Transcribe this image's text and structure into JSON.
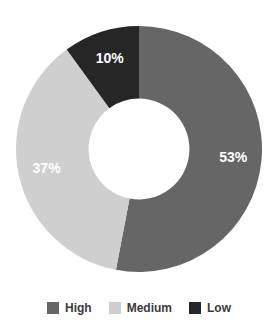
{
  "chart_data": {
    "type": "pie",
    "variant": "donut",
    "title": "",
    "xlabel": "",
    "ylabel": "",
    "categories": [
      "High",
      "Medium",
      "Low"
    ],
    "values": [
      53,
      37,
      10
    ],
    "unit": "%",
    "data_labels": [
      "53%",
      "37%",
      "10%"
    ],
    "colors": [
      "#666666",
      "#cfcfcf",
      "#262626"
    ],
    "label_color": "#ffffff",
    "background": "#ffffff",
    "start_angle_deg": 0,
    "direction": "clockwise",
    "inner_radius_ratio": 0.41,
    "grid": false,
    "legend": {
      "position": "bottom",
      "entries": [
        {
          "label": "High",
          "color": "#666666",
          "value": 53,
          "data_label": "53%"
        },
        {
          "label": "Medium",
          "color": "#cfcfcf",
          "value": 37,
          "data_label": "37%"
        },
        {
          "label": "Low",
          "color": "#262626",
          "value": 10,
          "data_label": "10%"
        }
      ]
    }
  },
  "slices": [
    {
      "name": "high",
      "data_label": "53%",
      "label_x": 203,
      "label_y": 159
    },
    {
      "name": "medium",
      "data_label": "37%",
      "label_x": 51,
      "label_y": 154
    },
    {
      "name": "low",
      "data_label": "10%",
      "label_x": 113,
      "label_y": 46
    }
  ]
}
